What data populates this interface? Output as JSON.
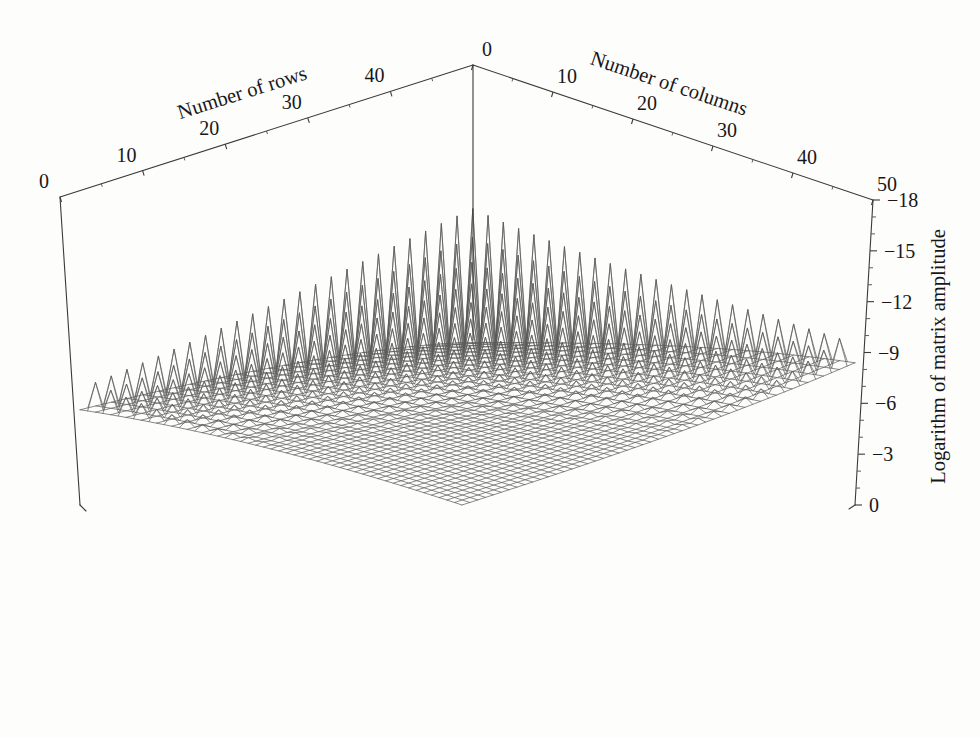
{
  "figure": {
    "background_color": "#fdfdfb",
    "line_color": "#5a5a58",
    "axis_color": "#3a3a38",
    "text_color": "#17171a"
  },
  "axes": {
    "rows": {
      "title": "Number of rows",
      "tick_labels": [
        "0",
        "10",
        "20",
        "30",
        "40"
      ],
      "tick_values": [
        0,
        10,
        20,
        30,
        40
      ],
      "range": [
        0,
        50
      ],
      "minor_ticks_per_major": 2
    },
    "columns": {
      "title": "Number of columns",
      "tick_labels": [
        "0",
        "10",
        "20",
        "30",
        "40",
        "50"
      ],
      "tick_values": [
        0,
        10,
        20,
        30,
        40,
        50
      ],
      "range": [
        0,
        50
      ],
      "minor_ticks_per_major": 2
    },
    "amplitude": {
      "title": "Logarithm of matrix amplitude",
      "tick_labels": [
        "−18",
        "−15",
        "−12",
        "−9",
        "−6",
        "−3",
        "0"
      ],
      "tick_values": [
        -18,
        -15,
        -12,
        -9,
        -6,
        -3,
        0
      ],
      "range": [
        -18,
        0
      ],
      "minor_ticks_per_major": 2,
      "orientation": "vertical-rotated"
    }
  },
  "chart_data": {
    "type": "surface",
    "title": "",
    "xlabel": "Number of columns",
    "ylabel": "Number of rows",
    "zlabel": "Logarithm of matrix amplitude",
    "grid": false,
    "legend": "none",
    "projection": "isometric-wireframe",
    "mesh_size": [
      51,
      51
    ],
    "xlim": [
      0,
      50
    ],
    "ylim": [
      0,
      50
    ],
    "zlim": [
      -18,
      0
    ],
    "z_tick_labels": [
      "−18",
      "−15",
      "−12",
      "−9",
      "−6",
      "−3",
      "0"
    ],
    "x_tick_labels": [
      "0",
      "10",
      "20",
      "30",
      "40",
      "50"
    ],
    "y_tick_labels": [
      "0",
      "10",
      "20",
      "30",
      "40"
    ],
    "surface_model": {
      "description": "log10 amplitude of matrix entries: smooth bowl decaying from corners to a low plateau at the back, with an oscillatory ridge component producing alternating spikes along rows near the back edge",
      "base_min": -18.0,
      "base_max": 0.0,
      "plateau_z": -9.5,
      "corner_front_z": 0.0,
      "corner_left_z": -5.5,
      "corner_right_z": -16.0,
      "oscillation_amplitude_max": 7.0,
      "oscillation_period_rows": 2
    },
    "notes": [
      "Surface is highest (z near 0) at the front corner nearest the viewer",
      "Surface falls away toward the back, reaching roughly -9 in the dark central plateau",
      "Spiky oscillating ridge runs along the back edges, rising to about -15 to -18 near the right corner",
      "Left back corner spikes are shallower, around -5 to -8"
    ]
  },
  "geometry": {
    "apex": [
      473,
      65
    ],
    "left_top": [
      60,
      197
    ],
    "right_top": [
      873,
      200
    ],
    "left_bottom": [
      80,
      505
    ],
    "right_bottom": [
      855,
      505
    ],
    "front": [
      465,
      718
    ]
  },
  "bleed_through": {
    "visible": true,
    "lines": [
      "",
      ""
    ]
  }
}
